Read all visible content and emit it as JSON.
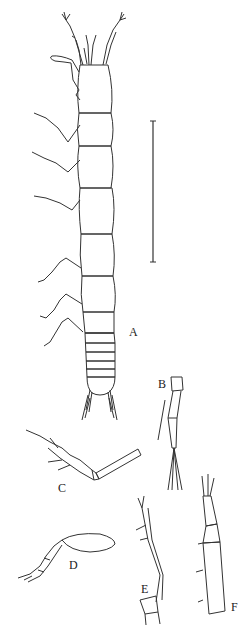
{
  "figure": {
    "labels": {
      "A": "A",
      "B": "B",
      "C": "C",
      "D": "D",
      "E": "E",
      "F": "F"
    },
    "parts": [
      {
        "id": "A",
        "name": "habitus-dorsal-view"
      },
      {
        "id": "B",
        "name": "appendage-detail-b"
      },
      {
        "id": "C",
        "name": "leg-c"
      },
      {
        "id": "D",
        "name": "leg-d"
      },
      {
        "id": "E",
        "name": "antenna-e"
      },
      {
        "id": "F",
        "name": "antenna-f"
      }
    ],
    "scale_bar": {
      "present": true
    },
    "line_color": "#333333",
    "background": "#ffffff"
  }
}
